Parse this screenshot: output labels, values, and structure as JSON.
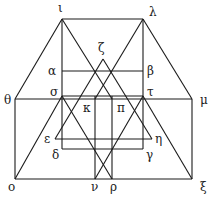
{
  "diagram": {
    "type": "geometric-construction",
    "stroke_color": "#1a1a1a",
    "background": "#ffffff",
    "points": {
      "iota": {
        "label": "ι",
        "x": 62,
        "y": 19,
        "lx": 58,
        "ly": 12
      },
      "lambda": {
        "label": "λ",
        "x": 143,
        "y": 19,
        "lx": 149,
        "ly": 16
      },
      "zeta": {
        "label": "ζ",
        "x": 103,
        "y": 59,
        "lx": 98,
        "ly": 52
      },
      "alpha": {
        "label": "α",
        "x": 62,
        "y": 71,
        "lx": 48,
        "ly": 75
      },
      "beta": {
        "label": "β",
        "x": 143,
        "y": 71,
        "lx": 147,
        "ly": 75
      },
      "sigma": {
        "label": "σ",
        "x": 62,
        "y": 96,
        "lx": 50,
        "ly": 96
      },
      "tau": {
        "label": "τ",
        "x": 143,
        "y": 96,
        "lx": 147,
        "ly": 96
      },
      "theta": {
        "label": "θ",
        "x": 15,
        "y": 99,
        "lx": 4,
        "ly": 104
      },
      "mu": {
        "label": "μ",
        "x": 192,
        "y": 99,
        "lx": 200,
        "ly": 104
      },
      "kappa": {
        "label": "κ",
        "x": 95,
        "y": 99,
        "lx": 83,
        "ly": 112
      },
      "pi": {
        "label": "π",
        "x": 112,
        "y": 99,
        "lx": 117,
        "ly": 112
      },
      "epsilon": {
        "label": "ε",
        "x": 55,
        "y": 139,
        "lx": 44,
        "ly": 143
      },
      "eta": {
        "label": "η",
        "x": 152,
        "y": 139,
        "lx": 155,
        "ly": 143
      },
      "delta": {
        "label": "δ",
        "x": 62,
        "y": 149,
        "lx": 52,
        "ly": 159
      },
      "gamma": {
        "label": "γ",
        "x": 143,
        "y": 149,
        "lx": 146,
        "ly": 159
      },
      "omicron": {
        "label": "ο",
        "x": 15,
        "y": 179,
        "lx": 8,
        "ly": 191
      },
      "nu": {
        "label": "ν",
        "x": 95,
        "y": 179,
        "lx": 91,
        "ly": 191
      },
      "rho": {
        "label": "ρ",
        "x": 112,
        "y": 179,
        "lx": 110,
        "ly": 191
      },
      "xi": {
        "label": "ξ",
        "x": 192,
        "y": 179,
        "lx": 200,
        "ly": 191
      }
    },
    "segments": [
      [
        "iota",
        "lambda"
      ],
      [
        "theta",
        "iota"
      ],
      [
        "lambda",
        "mu"
      ],
      [
        "theta",
        "mu"
      ],
      [
        "theta",
        "omicron"
      ],
      [
        "mu",
        "xi"
      ],
      [
        "omicron",
        "xi"
      ],
      [
        "iota",
        "delta"
      ],
      [
        "lambda",
        "gamma"
      ],
      [
        "alpha",
        "beta"
      ],
      [
        "sigma",
        "tau"
      ],
      [
        "delta",
        "gamma"
      ],
      [
        "epsilon",
        "eta"
      ],
      [
        "zeta",
        "epsilon"
      ],
      [
        "zeta",
        "eta"
      ],
      [
        "iota",
        "pi"
      ],
      [
        "lambda",
        "kappa"
      ],
      [
        "omicron",
        "sigma"
      ],
      [
        "sigma",
        "rho"
      ],
      [
        "xi",
        "tau"
      ],
      [
        "tau",
        "nu"
      ],
      [
        "kappa_top",
        "nu"
      ],
      [
        "pi_top",
        "rho"
      ]
    ],
    "extra_points": {
      "kappa_top": {
        "x": 95,
        "y": 96
      },
      "pi_top": {
        "x": 112,
        "y": 96
      }
    }
  }
}
